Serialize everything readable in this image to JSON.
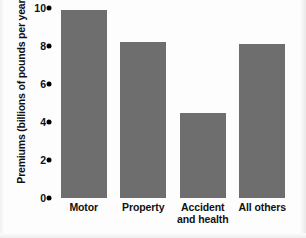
{
  "chart_data": {
    "type": "bar",
    "title": "",
    "xlabel": "",
    "ylabel": "Premiums (billions of pounds per year)",
    "ylim": [
      0,
      10
    ],
    "yticks": [
      0,
      2,
      4,
      6,
      8,
      10
    ],
    "ytick_labels": [
      "0",
      "2",
      "4",
      "6",
      "8",
      "10"
    ],
    "grid": false,
    "legend": false,
    "bar_color": "#6e6e6e",
    "categories": [
      "Motor",
      "Property",
      "Accident and health",
      "All others"
    ],
    "category_lines": [
      [
        "Motor"
      ],
      [
        "Property"
      ],
      [
        "Accident",
        "and health"
      ],
      [
        "All others"
      ]
    ],
    "values": [
      9.9,
      8.2,
      4.5,
      8.1
    ]
  },
  "colors": {
    "bar": "#6e6e6e",
    "text": "#111111",
    "background": "#fdfdfd"
  }
}
